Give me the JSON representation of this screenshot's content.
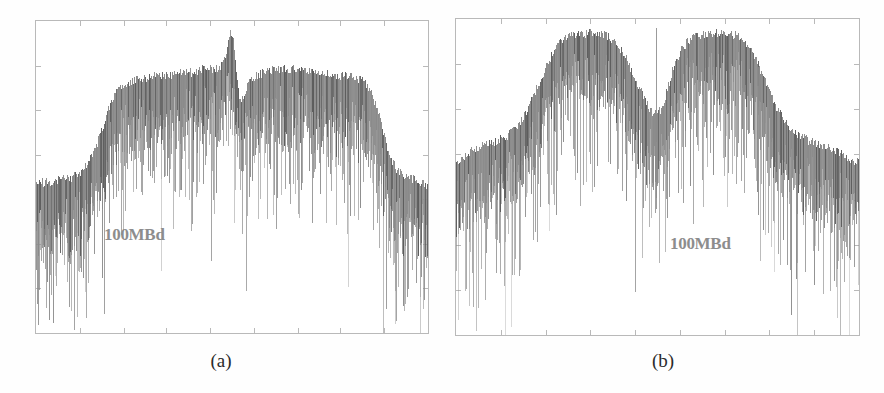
{
  "figure": {
    "background_color": "#ffffff",
    "trace_color": "#8a8a8a",
    "trace_dark_color": "#5c5c5c",
    "frame_color": "#b9b9b9",
    "label_color": "#8d8d8d",
    "caption_color": "#2b2b2b"
  },
  "panels": [
    {
      "id": "a",
      "caption": "(a)",
      "inline_label": "100MBd",
      "frame": {
        "x": 35,
        "y": 20,
        "width": 394,
        "height": 314
      },
      "x_ticks": 8,
      "y_ticks": 6
    },
    {
      "id": "b",
      "caption": "(b)",
      "inline_label": "100MBd",
      "frame": {
        "x": 13,
        "y": 18,
        "width": 405,
        "height": 318
      },
      "x_ticks": 8,
      "y_ticks": 6
    }
  ],
  "chart_data": [
    {
      "type": "line",
      "id": "spectrum-a",
      "title": "",
      "subtitle": "",
      "xlabel": "",
      "ylabel": "",
      "annotations": [
        {
          "text": "100MBd",
          "x_frac": 0.18,
          "y_frac": 0.66
        }
      ],
      "grid": false,
      "legend": null,
      "axis_labels_visible": false,
      "xlim": [
        0,
        1
      ],
      "ylim": [
        0,
        1
      ],
      "description": "Noisy RF spectrum-analyser trace: flat-topped shoulder with a narrow central carrier spike and symmetric roll-off skirts.",
      "noise_band_db": 0.34,
      "envelope_x": [
        0.0,
        0.02,
        0.04,
        0.06,
        0.08,
        0.1,
        0.12,
        0.14,
        0.16,
        0.18,
        0.2,
        0.22,
        0.24,
        0.26,
        0.28,
        0.3,
        0.32,
        0.34,
        0.36,
        0.38,
        0.4,
        0.42,
        0.44,
        0.455,
        0.47,
        0.48,
        0.49,
        0.495,
        0.5,
        0.505,
        0.51,
        0.52,
        0.53,
        0.545,
        0.56,
        0.58,
        0.6,
        0.62,
        0.64,
        0.66,
        0.68,
        0.7,
        0.72,
        0.74,
        0.76,
        0.78,
        0.8,
        0.82,
        0.84,
        0.86,
        0.88,
        0.9,
        0.92,
        0.94,
        0.96,
        0.98,
        1.0
      ],
      "envelope_y": [
        0.47,
        0.48,
        0.48,
        0.49,
        0.49,
        0.5,
        0.52,
        0.56,
        0.62,
        0.7,
        0.76,
        0.79,
        0.8,
        0.81,
        0.81,
        0.82,
        0.82,
        0.82,
        0.83,
        0.83,
        0.83,
        0.84,
        0.84,
        0.84,
        0.85,
        0.86,
        0.93,
        0.96,
        0.96,
        0.93,
        0.86,
        0.74,
        0.76,
        0.8,
        0.82,
        0.83,
        0.84,
        0.84,
        0.84,
        0.84,
        0.84,
        0.83,
        0.83,
        0.83,
        0.82,
        0.82,
        0.82,
        0.81,
        0.8,
        0.76,
        0.68,
        0.58,
        0.52,
        0.5,
        0.49,
        0.48,
        0.47
      ],
      "carrier_spike": {
        "x_frac": 0.494,
        "peak_y_frac": 0.97
      }
    },
    {
      "type": "line",
      "id": "spectrum-b",
      "title": "",
      "subtitle": "",
      "xlabel": "",
      "ylabel": "",
      "annotations": [
        {
          "text": "100MBd",
          "x_frac": 0.58,
          "y_frac": 0.7
        }
      ],
      "grid": false,
      "legend": null,
      "axis_labels_visible": false,
      "xlim": [
        0,
        1
      ],
      "ylim": [
        0,
        1
      ],
      "description": "Noisy RF spectrum-analyser trace: carrier-suppressed double-hump spectrum with a deep central notch and a thin residual carrier line.",
      "noise_band_db": 0.34,
      "envelope_x": [
        0.0,
        0.02,
        0.04,
        0.06,
        0.08,
        0.1,
        0.12,
        0.14,
        0.16,
        0.18,
        0.2,
        0.22,
        0.24,
        0.26,
        0.28,
        0.3,
        0.32,
        0.34,
        0.36,
        0.38,
        0.4,
        0.42,
        0.44,
        0.455,
        0.47,
        0.48,
        0.49,
        0.5,
        0.51,
        0.52,
        0.53,
        0.545,
        0.56,
        0.58,
        0.6,
        0.62,
        0.64,
        0.66,
        0.68,
        0.7,
        0.72,
        0.74,
        0.76,
        0.78,
        0.8,
        0.82,
        0.84,
        0.86,
        0.88,
        0.9,
        0.92,
        0.94,
        0.96,
        0.98,
        1.0
      ],
      "envelope_y": [
        0.54,
        0.56,
        0.58,
        0.59,
        0.6,
        0.61,
        0.62,
        0.64,
        0.67,
        0.72,
        0.78,
        0.84,
        0.89,
        0.92,
        0.94,
        0.95,
        0.95,
        0.95,
        0.95,
        0.94,
        0.92,
        0.88,
        0.82,
        0.78,
        0.74,
        0.71,
        0.7,
        0.7,
        0.71,
        0.75,
        0.8,
        0.86,
        0.9,
        0.93,
        0.94,
        0.95,
        0.95,
        0.95,
        0.95,
        0.94,
        0.92,
        0.88,
        0.83,
        0.77,
        0.71,
        0.67,
        0.64,
        0.62,
        0.61,
        0.6,
        0.59,
        0.58,
        0.57,
        0.55,
        0.54
      ],
      "carrier_spike": {
        "x_frac": 0.497,
        "peak_y_frac": 0.97
      }
    }
  ]
}
